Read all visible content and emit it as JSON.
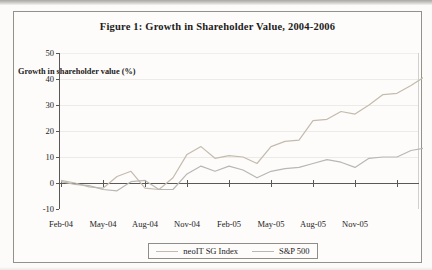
{
  "chart_data": {
    "type": "line",
    "title": "Figure 1: Growth in Shareholder Value, 2004-2006",
    "ylabel": "Growth in shareholder value (%)",
    "xlabel": "",
    "ylim": [
      -10,
      50
    ],
    "ytick_interval": 10,
    "y_tick_labels": [
      "50",
      "40",
      "30",
      "20",
      "10",
      "0",
      "-10"
    ],
    "grid": "horizontal-faint",
    "legend_position": "bottom-center",
    "x": [
      "Feb-04",
      "Mar-04",
      "Apr-04",
      "May-04",
      "Jun-04",
      "Jul-04",
      "Aug-04",
      "Sep-04",
      "Oct-04",
      "Nov-04",
      "Dec-04",
      "Jan-05",
      "Feb-05",
      "Mar-05",
      "Apr-05",
      "May-05",
      "Jun-05",
      "Jul-05",
      "Aug-05",
      "Sep-05",
      "Oct-05",
      "Nov-05",
      "Dec-05",
      "Jan-06",
      "Feb-06",
      "Mar-06",
      "Apr-06"
    ],
    "x_axis_tick_labels": [
      "Feb-04",
      "May-04",
      "Aug-04",
      "Nov-04",
      "Feb-05",
      "May-05",
      "Aug-05",
      "Nov-05"
    ],
    "series": [
      {
        "name": "neoIT SG Index",
        "color": "#c3bbac",
        "values": [
          1,
          0,
          -1.5,
          -2,
          2.5,
          4.5,
          -2,
          -2.5,
          2,
          11,
          14,
          9.5,
          10.5,
          10,
          7.5,
          14,
          16,
          16.5,
          24,
          24.5,
          27.5,
          26.5,
          30,
          34,
          34.5,
          37.5,
          41
        ]
      },
      {
        "name": "S&P 500",
        "color": "#b8b7b5",
        "values": [
          0.5,
          -0.5,
          -1,
          -2.5,
          -3,
          0.5,
          1,
          -2.5,
          -2.5,
          3.5,
          6.5,
          4.5,
          6.5,
          5,
          2,
          4.5,
          5.5,
          6,
          7.5,
          9,
          8,
          6,
          9.5,
          10,
          10,
          12.5,
          13.5
        ]
      }
    ]
  },
  "colors": {
    "axis": "#5a5854",
    "gridline": "#edebe7",
    "plot_right_border": "#d2d0cc",
    "text": "#1c1b1a"
  }
}
